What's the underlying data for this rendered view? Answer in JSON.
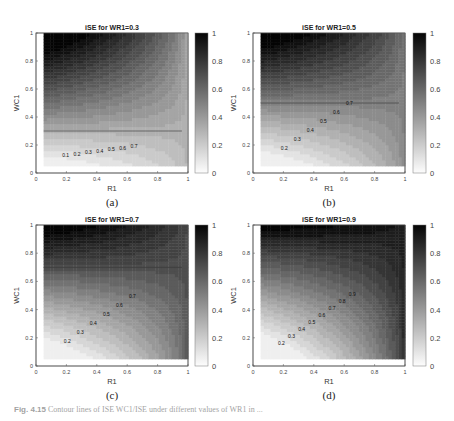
{
  "figure": {
    "caption_label": "Fig. 4.15",
    "caption_text": "Contour lines of ISE WC1/ISE under different values of WR1 in ..."
  },
  "chart_data": [
    {
      "type": "contour",
      "panel_label": "(a)",
      "title": "iSE for WR1=0.3",
      "xlabel": "R1",
      "ylabel": "WC1",
      "xlim": [
        0,
        1
      ],
      "ylim": [
        0,
        1
      ],
      "xticks": [
        "0",
        "0.2",
        "0.4",
        "0.6",
        "0.8",
        "1"
      ],
      "yticks": [
        "0",
        "0.2",
        "0.4",
        "0.6",
        "0.8",
        "1"
      ],
      "colorbar": {
        "range": [
          0,
          1
        ],
        "ticks": [
          "0",
          "0.2",
          "0.4",
          "0.6",
          "0.8",
          "1"
        ],
        "colormap": "gray (white=0, black=1)"
      },
      "data_domain": {
        "x": [
          0.05,
          1
        ],
        "y": [
          0.05,
          1
        ]
      },
      "plateau_level": 0.3,
      "plateau_boundary_wc1": 0.3,
      "contour_labels": [
        "0.1",
        "0.2",
        "0.3",
        "0.4",
        "0.5",
        "0.6",
        "0.7"
      ],
      "max_value_corner": "R1=0.05, WC1=1 (~1.0)"
    },
    {
      "type": "contour",
      "panel_label": "(b)",
      "title": "iSE for WR1=0.5",
      "xlabel": "R1",
      "ylabel": "WC1",
      "xlim": [
        0,
        1
      ],
      "ylim": [
        0,
        1
      ],
      "xticks": [
        "0",
        "0.2",
        "0.4",
        "0.6",
        "0.8",
        "1"
      ],
      "yticks": [
        "0",
        "0.2",
        "0.4",
        "0.6",
        "0.8",
        "1"
      ],
      "colorbar": {
        "range": [
          0,
          1
        ],
        "ticks": [
          "0",
          "0.2",
          "0.4",
          "0.6",
          "0.8",
          "1"
        ],
        "colormap": "gray (white=0, black=1)"
      },
      "data_domain": {
        "x": [
          0.05,
          1
        ],
        "y": [
          0.05,
          1
        ]
      },
      "plateau_level": 0.5,
      "plateau_boundary_wc1": 0.5,
      "contour_labels": [
        "0.2",
        "0.3",
        "0.4",
        "0.5",
        "0.6",
        "0.7"
      ],
      "max_value_corner": "R1=0.05, WC1=1 (~1.0)"
    },
    {
      "type": "contour",
      "panel_label": "(c)",
      "title": "iSE for WR1=0.7",
      "xlabel": "R1",
      "ylabel": "WC1",
      "xlim": [
        0,
        1
      ],
      "ylim": [
        0,
        1
      ],
      "xticks": [
        "0",
        "0.2",
        "0.4",
        "0.6",
        "0.8",
        "1"
      ],
      "yticks": [
        "0",
        "0.2",
        "0.4",
        "0.6",
        "0.8",
        "1"
      ],
      "colorbar": {
        "range": [
          0,
          1
        ],
        "ticks": [
          "0",
          "0.2",
          "0.4",
          "0.6",
          "0.8",
          "1"
        ],
        "colormap": "gray (white=0, black=1)"
      },
      "data_domain": {
        "x": [
          0.05,
          1
        ],
        "y": [
          0.05,
          1
        ]
      },
      "plateau_level": 0.7,
      "plateau_boundary_wc1": 0.7,
      "contour_labels": [
        "0.2",
        "0.3",
        "0.4",
        "0.5",
        "0.6",
        "0.7"
      ],
      "max_value_corner": "R1=0.05, WC1=1 (~1.0)"
    },
    {
      "type": "contour",
      "panel_label": "(d)",
      "title": "iSE for WR1=0.9",
      "xlabel": "R1",
      "ylabel": "WC1",
      "xlim": [
        0,
        1
      ],
      "ylim": [
        0,
        1
      ],
      "xticks": [
        "0",
        "0.2",
        "0.4",
        "0.6",
        "0.8",
        "1"
      ],
      "yticks": [
        "0",
        "0.2",
        "0.4",
        "0.6",
        "0.8",
        "1"
      ],
      "colorbar": {
        "range": [
          0,
          1
        ],
        "ticks": [
          "0",
          "0.2",
          "0.4",
          "0.6",
          "0.8",
          "1"
        ],
        "colormap": "gray (white=0, black=1)"
      },
      "data_domain": {
        "x": [
          0.05,
          1
        ],
        "y": [
          0.05,
          1
        ]
      },
      "plateau_level": 0.9,
      "plateau_boundary_wc1": 0.9,
      "contour_labels": [
        "0.2",
        "0.3",
        "0.4",
        "0.5",
        "0.6",
        "0.7",
        "0.8",
        "0.9"
      ],
      "max_value_corner": "R1=0.05, WC1=1 (~1.0)"
    }
  ],
  "layout": {
    "panels": [
      {
        "ax": [
          36,
          33,
          152,
          140
        ],
        "cb": [
          195,
          33,
          13,
          140
        ]
      },
      {
        "ax": [
          253,
          33,
          152,
          140
        ],
        "cb": [
          413,
          33,
          13,
          140
        ]
      },
      {
        "ax": [
          36,
          225,
          152,
          141
        ],
        "cb": [
          195,
          225,
          13,
          141
        ]
      },
      {
        "ax": [
          253,
          225,
          152,
          141
        ],
        "cb": [
          413,
          225,
          13,
          141
        ]
      }
    ]
  }
}
